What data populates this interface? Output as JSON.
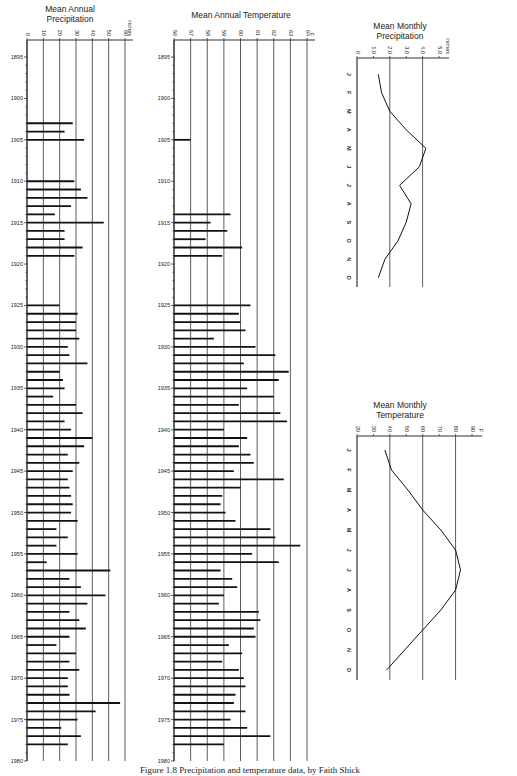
{
  "chart_data": [
    {
      "type": "bar",
      "orientation": "horizontal",
      "title": "Mean Annual Precipitation",
      "title_lines": [
        "Mean Annual",
        "Precipitation"
      ],
      "xlabel": "inches",
      "ylabel": "",
      "xlim": [
        0,
        60
      ],
      "x_ticks": [
        "0",
        "10",
        "20",
        "30",
        "40",
        "50",
        "60"
      ],
      "y_ticks": [
        "1895",
        "1900",
        "1905",
        "1910",
        "1915",
        "1920",
        "1925",
        "1930",
        "1935",
        "1940",
        "1945",
        "1950",
        "1955",
        "1960",
        "1965",
        "1970",
        "1975",
        "1980"
      ],
      "grid": true,
      "categories": [
        1903,
        1904,
        1905,
        1910,
        1911,
        1912,
        1913,
        1914,
        1915,
        1916,
        1917,
        1918,
        1919,
        1925,
        1926,
        1927,
        1928,
        1929,
        1930,
        1931,
        1932,
        1933,
        1934,
        1935,
        1936,
        1937,
        1938,
        1939,
        1940,
        1941,
        1942,
        1943,
        1944,
        1945,
        1946,
        1947,
        1948,
        1949,
        1950,
        1951,
        1952,
        1953,
        1954,
        1955,
        1956,
        1957,
        1958,
        1959,
        1960,
        1961,
        1962,
        1963,
        1964,
        1965,
        1966,
        1967,
        1968,
        1969,
        1970,
        1971,
        1972,
        1973,
        1974,
        1975,
        1976,
        1977,
        1978
      ],
      "values": [
        28,
        23,
        35,
        29,
        33,
        37,
        27,
        17,
        47,
        23,
        23,
        34,
        29,
        20,
        31,
        30,
        30,
        32,
        25,
        26,
        37,
        20,
        22,
        23,
        16,
        30,
        34,
        23,
        27,
        40,
        35,
        25,
        32,
        28,
        25,
        26,
        27,
        28,
        27,
        31,
        18,
        25,
        18,
        31,
        12,
        51,
        26,
        33,
        48,
        37,
        26,
        32,
        36,
        26,
        18,
        30,
        26,
        32,
        25,
        25,
        26,
        57,
        42,
        31,
        21,
        33,
        25
      ]
    },
    {
      "type": "bar",
      "orientation": "horizontal",
      "title": "Mean Annual Temperature",
      "title_lines": [
        "Mean Annual Temperature"
      ],
      "xlabel": "F",
      "ylabel": "",
      "xlim": [
        56,
        64
      ],
      "x_ticks": [
        "56",
        "57",
        "58",
        "59",
        "60",
        "61",
        "62",
        "63",
        "64"
      ],
      "y_ticks": [
        "1895",
        "1900",
        "1905",
        "1910",
        "1915",
        "1920",
        "1925",
        "1930",
        "1935",
        "1940",
        "1945",
        "1950",
        "1955",
        "1960",
        "1965",
        "1970",
        "1975",
        "1980"
      ],
      "grid": true,
      "categories": [
        1905,
        1914,
        1915,
        1916,
        1917,
        1918,
        1919,
        1925,
        1926,
        1927,
        1928,
        1929,
        1930,
        1931,
        1932,
        1933,
        1934,
        1935,
        1936,
        1937,
        1938,
        1939,
        1940,
        1941,
        1942,
        1943,
        1944,
        1945,
        1946,
        1947,
        1948,
        1949,
        1950,
        1951,
        1952,
        1953,
        1954,
        1955,
        1956,
        1957,
        1958,
        1959,
        1960,
        1961,
        1962,
        1963,
        1964,
        1965,
        1966,
        1967,
        1968,
        1969,
        1970,
        1971,
        1972,
        1973,
        1974,
        1975,
        1976,
        1977,
        1978
      ],
      "values": [
        57.0,
        59.4,
        58.2,
        59.2,
        57.9,
        60.1,
        58.9,
        60.6,
        59.9,
        60.0,
        60.3,
        58.4,
        60.9,
        62.1,
        60.2,
        62.9,
        62.3,
        60.4,
        62.0,
        59.9,
        62.4,
        62.8,
        59.0,
        60.4,
        59.9,
        60.6,
        60.8,
        59.6,
        62.6,
        60.0,
        58.9,
        58.8,
        59.1,
        59.7,
        61.8,
        62.1,
        63.6,
        60.7,
        62.3,
        58.8,
        59.5,
        59.8,
        59.0,
        58.7,
        61.1,
        61.2,
        60.8,
        60.9,
        59.3,
        60.1,
        58.9,
        59.9,
        60.2,
        60.3,
        59.7,
        59.6,
        60.3,
        59.4,
        60.4,
        61.8,
        59.0
      ]
    },
    {
      "type": "line",
      "title": "Mean Monthly Precipitation",
      "title_lines": [
        "Mean Monthly",
        "Precipitation"
      ],
      "xlabel": "inches",
      "xlim": [
        0,
        5.0
      ],
      "x_ticks": [
        "0",
        "1.0",
        "2.0",
        "3.0",
        "4.0",
        "5.0"
      ],
      "categories": [
        "J",
        "F",
        "M",
        "A",
        "M",
        "J",
        "J",
        "A",
        "S",
        "O",
        "N",
        "D"
      ],
      "values": [
        1.3,
        1.5,
        2.0,
        3.0,
        4.2,
        3.8,
        2.6,
        3.3,
        3.0,
        2.5,
        1.7,
        1.3
      ],
      "grid": true
    },
    {
      "type": "line",
      "title": "Mean Monthly Temperature",
      "title_lines": [
        "Mean Monthly",
        "Temperature"
      ],
      "xlabel": "F",
      "xlim": [
        20,
        90
      ],
      "x_ticks": [
        "20",
        "30",
        "40",
        "50",
        "60",
        "70",
        "80",
        "90"
      ],
      "categories": [
        "J",
        "F",
        "M",
        "A",
        "M",
        "J",
        "J",
        "A",
        "S",
        "O",
        "N",
        "D"
      ],
      "values": [
        37,
        41,
        51,
        60,
        71,
        80,
        83,
        80,
        71,
        60,
        49,
        38
      ],
      "grid": true
    }
  ],
  "caption": "Figure 1.8   Precipitation and temperature data, by Faith Shick"
}
